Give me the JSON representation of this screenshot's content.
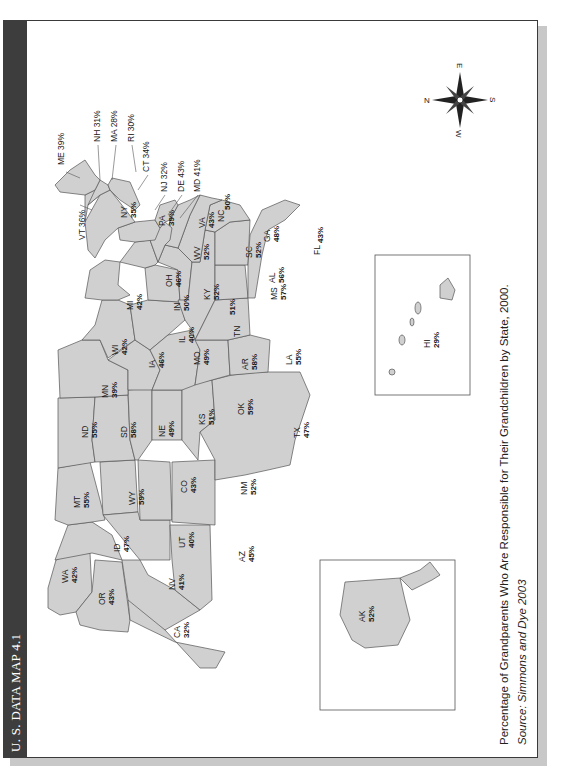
{
  "header": {
    "title": "U. S. DATA MAP 4.1"
  },
  "caption": {
    "title": "Percentage of Grandparents Who Are Responsible for Their Grandchildren by State, 2000.",
    "source": "Source: Simmons and Dye 2003"
  },
  "compass": {
    "n": "N",
    "e": "E",
    "s": "S",
    "w": "W"
  },
  "colors": {
    "titlebar": "#3d3d3d",
    "state_fill": "#d0d0d0",
    "state_stroke": "#555555",
    "frame": "#3a3a3a",
    "shadow": "#c8c8c8"
  },
  "states": {
    "WA": {
      "abbr": "WA",
      "value": "42%"
    },
    "OR": {
      "abbr": "OR",
      "value": "43%"
    },
    "CA": {
      "abbr": "CA",
      "value": "32%"
    },
    "ID": {
      "abbr": "ID",
      "value": "47%"
    },
    "NV": {
      "abbr": "NV",
      "value": "41%"
    },
    "MT": {
      "abbr": "MT",
      "value": "55%"
    },
    "WY": {
      "abbr": "WY",
      "value": "59%"
    },
    "UT": {
      "abbr": "UT",
      "value": "40%"
    },
    "AZ": {
      "abbr": "AZ",
      "value": "45%"
    },
    "CO": {
      "abbr": "CO",
      "value": "43%"
    },
    "NM": {
      "abbr": "NM",
      "value": "52%"
    },
    "ND": {
      "abbr": "ND",
      "value": "55%"
    },
    "SD": {
      "abbr": "SD",
      "value": "58%"
    },
    "NE": {
      "abbr": "NE",
      "value": "49%"
    },
    "KS": {
      "abbr": "KS",
      "value": "51%"
    },
    "OK": {
      "abbr": "OK",
      "value": "59%"
    },
    "TX": {
      "abbr": "TX",
      "value": "47%"
    },
    "MN": {
      "abbr": "MN",
      "value": "39%"
    },
    "IA": {
      "abbr": "IA",
      "value": "46%"
    },
    "MO": {
      "abbr": "MO",
      "value": "49%"
    },
    "AR": {
      "abbr": "AR",
      "value": "58%"
    },
    "LA": {
      "abbr": "LA",
      "value": "55%"
    },
    "WI": {
      "abbr": "WI",
      "value": "42%"
    },
    "IL": {
      "abbr": "IL",
      "value": "40%"
    },
    "MI": {
      "abbr": "MI",
      "value": "42%"
    },
    "IN": {
      "abbr": "IN",
      "value": "50%"
    },
    "OH": {
      "abbr": "OH",
      "value": "46%"
    },
    "KY": {
      "abbr": "KY",
      "value": "52%"
    },
    "TN": {
      "abbr": "TN",
      "value": "51%"
    },
    "MS": {
      "abbr": "MS",
      "value": "57%"
    },
    "AL": {
      "abbr": "AL",
      "value": "56%"
    },
    "GA": {
      "abbr": "GA",
      "value": "48%"
    },
    "FL": {
      "abbr": "FL",
      "value": "43%"
    },
    "SC": {
      "abbr": "SC",
      "value": "52%"
    },
    "NC": {
      "abbr": "NC",
      "value": "50%"
    },
    "VA": {
      "abbr": "VA",
      "value": "43%"
    },
    "WV": {
      "abbr": "WV",
      "value": "52%"
    },
    "PA": {
      "abbr": "PA",
      "value": "39%"
    },
    "NY": {
      "abbr": "NY",
      "value": "35%"
    },
    "VT": {
      "label": "VT 36%"
    },
    "ME": {
      "label": "ME 39%"
    },
    "NH": {
      "label": "NH 31%"
    },
    "MA": {
      "label": "MA 28%"
    },
    "RI": {
      "label": "RI 30%"
    },
    "CT": {
      "label": "CT 34%"
    },
    "NJ": {
      "label": "NJ 32%"
    },
    "DE": {
      "label": "DE 43%"
    },
    "MD": {
      "label": "MD 41%"
    },
    "AK": {
      "abbr": "AK",
      "value": "52%"
    },
    "HI": {
      "abbr": "HI",
      "value": "29%"
    }
  }
}
